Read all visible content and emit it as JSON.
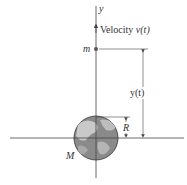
{
  "diagram": {
    "axis_label_y": "y",
    "velocity_label": "Velocity ",
    "velocity_symbol": "v(t)",
    "mass_small_label": "m",
    "mass_large_label": "M",
    "height_label": "y(t)",
    "radius_label": "R",
    "colors": {
      "line": "#444444",
      "globe_ocean": "#8a8a8a",
      "globe_land": "#c9c9c9",
      "dot": "#555555"
    }
  }
}
